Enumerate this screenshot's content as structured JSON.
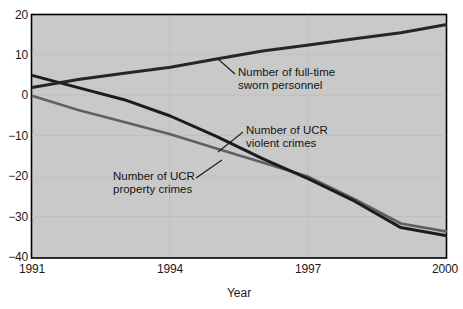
{
  "chart_data": {
    "type": "line",
    "title": "",
    "xlabel": "Year",
    "ylabel": "",
    "xlim": [
      1991,
      2000
    ],
    "ylim": [
      -40,
      20
    ],
    "ytick_labels": [
      "20",
      "10",
      "0",
      "−10",
      "−20",
      "−30",
      "−40"
    ],
    "ytick_values": [
      20,
      10,
      0,
      -10,
      -20,
      -30,
      -40
    ],
    "xtick_labels": [
      "1991",
      "1994",
      "1997",
      "2000"
    ],
    "xtick_values": [
      1991,
      1994,
      1997,
      2000
    ],
    "grid": true,
    "legend": "annotations",
    "plot_background": "#c9c9c9",
    "x": [
      1991,
      1992,
      1993,
      1994,
      1995,
      1996,
      1997,
      1998,
      1999,
      2000
    ],
    "series": [
      {
        "name": "Number of full-time sworn personnel",
        "color": "#262626",
        "values": [
          2.0,
          4.0,
          5.5,
          7.0,
          9.0,
          11.0,
          12.5,
          14.0,
          15.5,
          17.5
        ]
      },
      {
        "name": "Number of UCR violent crimes",
        "color": "#1c1c1c",
        "values": [
          5.0,
          2.0,
          -1.0,
          -5.0,
          -10.0,
          -15.5,
          -20.5,
          -26.0,
          -32.5,
          -34.5
        ]
      },
      {
        "name": "Number of UCR property crimes",
        "color": "#606060",
        "values": [
          0.0,
          -3.5,
          -6.5,
          -9.5,
          -13.0,
          -16.5,
          -20.0,
          -25.5,
          -31.5,
          -33.5
        ]
      }
    ],
    "annotations": [
      {
        "name": "sworn-personnel-annotation",
        "line1": "Number of full-time",
        "line2": "sworn personnel"
      },
      {
        "name": "violent-crimes-annotation",
        "line1": "Number of UCR",
        "line2": "violent crimes"
      },
      {
        "name": "property-crimes-annotation",
        "line1": "Number of UCR",
        "line2": "property crimes"
      }
    ]
  }
}
